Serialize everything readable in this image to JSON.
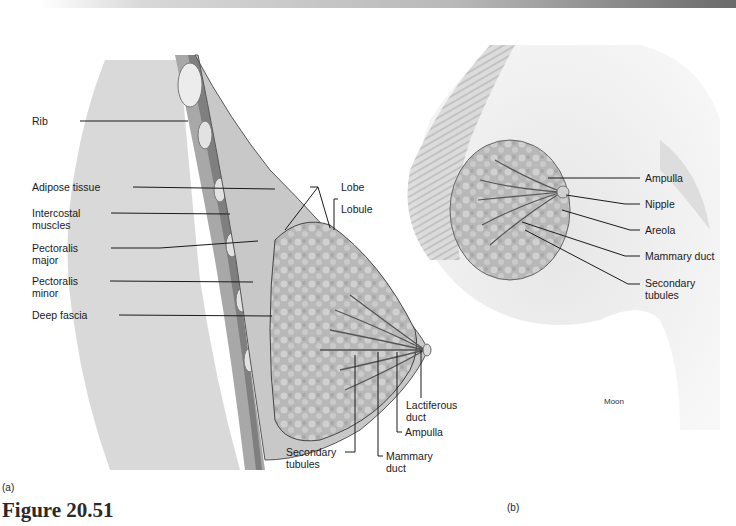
{
  "figure": {
    "title": "Figure 20.51",
    "panel_a": "(a)",
    "panel_b": "(b)",
    "credit": "Moon"
  },
  "panel_a_labels": {
    "rib": "Rib",
    "adipose_tissue": "Adipose tissue",
    "intercostal_muscles": "Intercostal\nmuscles",
    "pectoralis_major": "Pectoralis\nmajor",
    "pectoralis_minor": "Pectoralis\nminor",
    "deep_fascia": "Deep fascia",
    "lobe": "Lobe",
    "lobule": "Lobule",
    "lactiferous_duct": "Lactiferous\nduct",
    "ampulla": "Ampulla",
    "mammary_duct": "Mammary\nduct",
    "secondary_tubules": "Secondary\ntubules"
  },
  "panel_b_labels": {
    "ampulla": "Ampulla",
    "nipple": "Nipple",
    "areola": "Areola",
    "mammary_duct": "Mammary duct",
    "secondary_tubules": "Secondary\ntubules"
  },
  "colors": {
    "lung_fill": "#d9d9d9",
    "tissue_fill": "#c4c4c4",
    "muscle_fill": "#9a9a9a",
    "gland_fill": "#b5b5b5",
    "skin_fill": "#f0f0f0",
    "leader_line": "#1a1a1a"
  }
}
